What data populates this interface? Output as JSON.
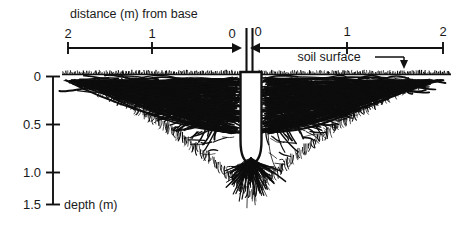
{
  "figure": {
    "title_top": "distance (m) from base",
    "depth_axis_title": "depth (m)",
    "soil_surface_label": "soil surface",
    "icons": {
      "arrow_right": "arrow-right-icon",
      "arrow_left": "arrow-left-icon",
      "arrow_down": "arrow-down-icon"
    }
  },
  "chart_data": {
    "type": "diagram",
    "title": "distance (m) from base",
    "xlabel": "distance (m) from base",
    "ylabel": "depth (m)",
    "x_left_ticks": [
      "2",
      "1",
      "0"
    ],
    "x_right_ticks": [
      "0",
      "1",
      "2"
    ],
    "y_ticks": [
      "0",
      "0.5",
      "1.0",
      "1.5"
    ],
    "ylim": [
      0,
      1.5
    ],
    "xlim_left": [
      2,
      0
    ],
    "xlim_right": [
      0,
      2
    ],
    "annotations": [
      "soil surface"
    ],
    "grid": false,
    "legend": "none"
  },
  "axis_labels": {
    "left": {
      "t2": "2",
      "t1": "1",
      "t0": "0"
    },
    "right": {
      "t0": "0",
      "t1": "1",
      "t2": "2"
    },
    "depth": {
      "d0": "0",
      "d05": "0.5",
      "d10": "1.0",
      "d15": "1.5"
    }
  },
  "colors": {
    "ink": "#111111",
    "background": "#ffffff"
  }
}
